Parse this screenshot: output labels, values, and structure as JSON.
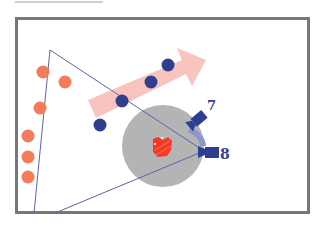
{
  "diagram": {
    "colors": {
      "frame": "#777777",
      "top_rule": "#9aa0b8",
      "background": "#ffffff",
      "team_orange": "#f47a5a",
      "team_blue": "#2e3f8f",
      "arrow": "#f6b0a6",
      "coverage_circle": "#b4b4b4",
      "sightline": "#5a64a8",
      "target": "#f23a25",
      "camera": "#2e3f8f",
      "camera_sweep": "#8a97cc"
    },
    "frame": {
      "x": 15,
      "y": 17,
      "w": 294,
      "h": 196,
      "stroke_width": 3
    },
    "top_rule": {
      "x1": 15,
      "y1": 2,
      "x2": 103,
      "y2": 2
    },
    "orange_dots": [
      {
        "cx": 43,
        "cy": 72
      },
      {
        "cx": 65,
        "cy": 82
      },
      {
        "cx": 40,
        "cy": 108
      },
      {
        "cx": 28,
        "cy": 136
      },
      {
        "cx": 28,
        "cy": 157
      },
      {
        "cx": 28,
        "cy": 177
      }
    ],
    "blue_dots": [
      {
        "cx": 100,
        "cy": 125
      },
      {
        "cx": 122,
        "cy": 101
      },
      {
        "cx": 151,
        "cy": 82
      },
      {
        "cx": 168,
        "cy": 65
      }
    ],
    "movement_arrow": {
      "from": [
        92,
        110
      ],
      "to": [
        206,
        60
      ]
    },
    "coverage_circle": {
      "cx": 163,
      "cy": 146,
      "r": 41
    },
    "target": {
      "cx": 161,
      "cy": 147
    },
    "cameras": [
      {
        "id": "7",
        "label": "7",
        "x": 196,
        "y": 121,
        "angle": -40,
        "label_x": 207,
        "label_y": 110
      },
      {
        "id": "8",
        "label": "8",
        "x": 205,
        "y": 152,
        "angle": 0,
        "label_x": 220,
        "label_y": 159
      }
    ],
    "sightlines": [
      {
        "x1": 50,
        "y1": 50,
        "x2": 34,
        "y2": 213
      },
      {
        "x1": 50,
        "y1": 50,
        "x2": 204,
        "y2": 151
      },
      {
        "x1": 204,
        "y1": 151,
        "x2": 55,
        "y2": 213
      }
    ]
  }
}
